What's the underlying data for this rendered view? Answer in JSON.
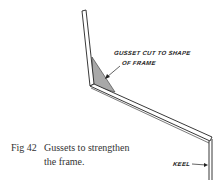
{
  "figure": {
    "number_label": "Fig 42",
    "caption_line1": "Gussets to strengthen",
    "caption_line2": "the frame.",
    "annotations": {
      "gusset_line1": "GUSSET CUT TO SHAPE",
      "gusset_line2": "OF FRAME",
      "keel": "KEEL"
    },
    "colors": {
      "line": "#222222",
      "gusset_fill": "#a8a8a8",
      "caption_text": "#333333"
    }
  }
}
